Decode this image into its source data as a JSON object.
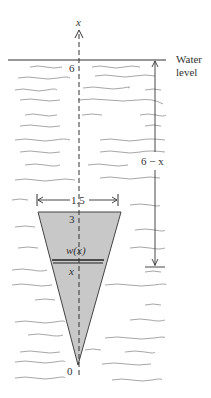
{
  "diagram": {
    "axis_label": "x",
    "water_level_label_line1": "Water",
    "water_level_label_line2": "level",
    "surface_value": "6",
    "depth_label": "6 − x",
    "width_label": "1.5",
    "top_value": "3",
    "strip_width_label": "w(x)",
    "strip_position_label": "x",
    "origin_value": "0",
    "colors": {
      "plate_fill": "#c8c8c8",
      "line": "#333333",
      "water_wave": "#8a8a8a"
    }
  }
}
